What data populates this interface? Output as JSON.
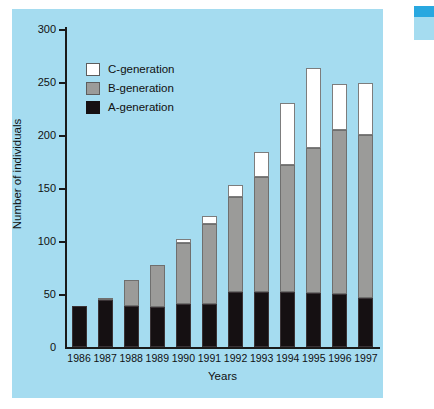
{
  "chart_data": {
    "type": "bar",
    "subtype": "stacked-bar",
    "title": "",
    "xlabel": "Years",
    "ylabel": "Number of individuals",
    "categories": [
      "1986",
      "1987",
      "1988",
      "1989",
      "1990",
      "1991",
      "1992",
      "1993",
      "1994",
      "1995",
      "1996",
      "1997"
    ],
    "series": [
      {
        "name": "A-generation",
        "color": "#151012",
        "values": [
          39,
          44,
          39,
          38,
          41,
          41,
          52,
          52,
          52,
          51,
          50,
          46
        ]
      },
      {
        "name": "B-generation",
        "color": "#9b9b99",
        "values": [
          0,
          2,
          24,
          39,
          57,
          75,
          90,
          108,
          120,
          137,
          155,
          154
        ]
      },
      {
        "name": "C-generation",
        "color": "#ffffff",
        "values": [
          0,
          0,
          0,
          0,
          4,
          8,
          11,
          24,
          58,
          75,
          43,
          49
        ]
      }
    ],
    "totals": [
      39,
      46,
      63,
      77,
      102,
      124,
      153,
      184,
      230,
      263,
      248,
      249
    ],
    "ylim": [
      0,
      300
    ],
    "yticks": [
      0,
      50,
      100,
      150,
      200,
      250,
      300
    ],
    "ytick_labels": [
      "0",
      "50",
      "100",
      "150",
      "200",
      "250",
      "300"
    ],
    "grid": false,
    "legend_position": "upper-left",
    "legend_entries": [
      "C-generation",
      "B-generation",
      "A-generation"
    ],
    "panel_background": "#a5dcf0",
    "axis_color": "#1a1a1a"
  }
}
